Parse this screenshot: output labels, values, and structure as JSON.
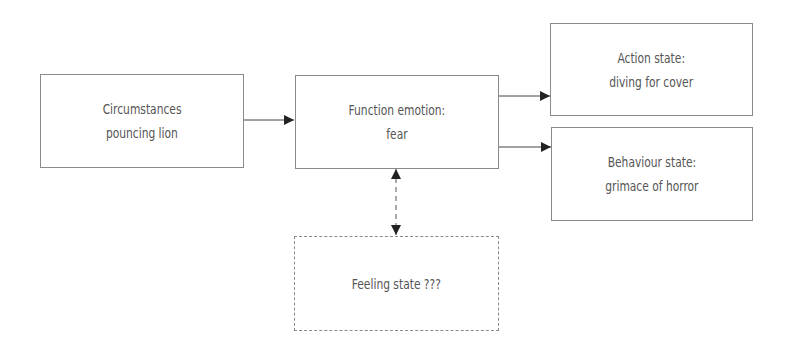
{
  "diagram": {
    "nodes": {
      "circumstances": {
        "line1": "Circumstances",
        "line2": "pouncing lion"
      },
      "function_emotion": {
        "line1": "Function emotion:",
        "line2": "fear"
      },
      "action_state": {
        "line1": "Action state:",
        "line2": "diving for cover"
      },
      "behaviour_state": {
        "line1": "Behaviour state:",
        "line2": "grimace of horror"
      },
      "feeling_state": {
        "line1": "Feeling state ???"
      }
    },
    "edges": [
      {
        "from": "circumstances",
        "to": "function_emotion",
        "style": "solid",
        "direction": "forward"
      },
      {
        "from": "function_emotion",
        "to": "action_state",
        "style": "solid",
        "direction": "forward"
      },
      {
        "from": "function_emotion",
        "to": "behaviour_state",
        "style": "solid",
        "direction": "forward"
      },
      {
        "from": "function_emotion",
        "to": "feeling_state",
        "style": "dashed",
        "direction": "bidirectional"
      }
    ],
    "colors": {
      "border": "#8a8a8a",
      "text": "#555555",
      "arrow": "#222222"
    }
  }
}
